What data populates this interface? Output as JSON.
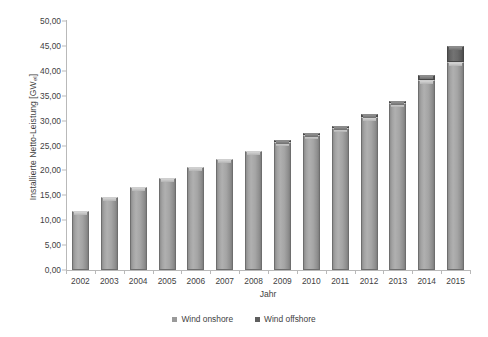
{
  "chart_data": {
    "type": "bar",
    "stacked": true,
    "title": "",
    "xlabel": "Jahr",
    "ylabel": "Installierte Netto-Leistung [GWel]",
    "ylabel_main": "Installierte Netto-Leistung [GW",
    "ylabel_sub": "el",
    "ylabel_tail": "]",
    "categories": [
      "2002",
      "2003",
      "2004",
      "2005",
      "2006",
      "2007",
      "2008",
      "2009",
      "2010",
      "2011",
      "2012",
      "2013",
      "2014",
      "2015"
    ],
    "series": [
      {
        "name": "Wind onshore",
        "color": "#a2a2a2",
        "values": [
          11.9,
          14.6,
          16.6,
          18.4,
          20.6,
          22.2,
          23.9,
          25.7,
          27.1,
          28.5,
          30.8,
          33.5,
          38.1,
          41.7
        ]
      },
      {
        "name": "Wind offshore",
        "color": "#6a6a6a",
        "values": [
          0.0,
          0.0,
          0.0,
          0.0,
          0.0,
          0.0,
          0.0,
          0.05,
          0.1,
          0.2,
          0.3,
          0.5,
          1.0,
          3.3
        ]
      }
    ],
    "totals": [
      11.9,
      14.6,
      16.6,
      18.4,
      20.6,
      22.2,
      23.9,
      25.75,
      27.2,
      28.7,
      31.1,
      34.0,
      39.1,
      45.0
    ],
    "ylim": [
      0,
      50
    ],
    "ytick_step": 5,
    "yticks": [
      "50,00",
      "45,00",
      "40,00",
      "35,00",
      "30,00",
      "25,00",
      "20,00",
      "15,00",
      "10,00",
      "5,00",
      "0,00"
    ],
    "ytick_values": [
      50,
      45,
      40,
      35,
      30,
      25,
      20,
      15,
      10,
      5,
      0
    ],
    "grid": false,
    "legend_position": "bottom"
  },
  "legend": {
    "entries": [
      {
        "label": "Wind onshore",
        "swatch": "onshore"
      },
      {
        "label": "Wind offshore",
        "swatch": "offshore"
      }
    ]
  }
}
